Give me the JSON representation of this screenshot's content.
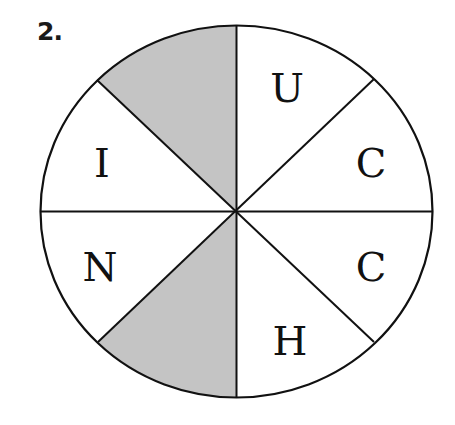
{
  "problem": {
    "number_label": "2."
  },
  "diagram": {
    "shape": "circle divided into 8 equal sectors",
    "shade_color": "#c4c4c4",
    "stroke_color": "#111111",
    "sectors": [
      {
        "position": "top-left",
        "letter": "",
        "shaded": true
      },
      {
        "position": "top-right",
        "letter": "U",
        "shaded": false
      },
      {
        "position": "right-upper",
        "letter": "C",
        "shaded": false
      },
      {
        "position": "right-lower",
        "letter": "C",
        "shaded": false
      },
      {
        "position": "bottom-right",
        "letter": "H",
        "shaded": false
      },
      {
        "position": "bottom-left",
        "letter": "",
        "shaded": true
      },
      {
        "position": "left-lower",
        "letter": "N",
        "shaded": false
      },
      {
        "position": "left-upper",
        "letter": "I",
        "shaded": false
      }
    ]
  }
}
